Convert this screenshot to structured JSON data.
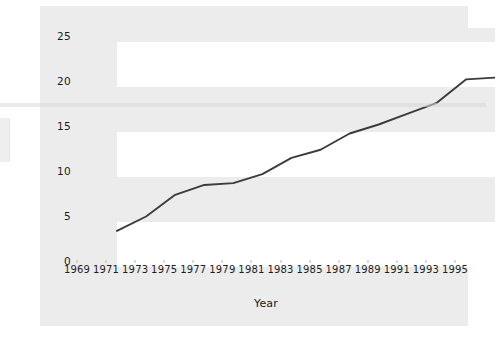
{
  "chart_data": {
    "type": "line",
    "title": "",
    "xlabel": "Year",
    "ylabel": "Women as a Percentage of All State Legislators",
    "x": [
      1969,
      1971,
      1973,
      1975,
      1977,
      1979,
      1981,
      1983,
      1985,
      1987,
      1989,
      1991,
      1993,
      1995
    ],
    "categories": [
      "1969",
      "1971",
      "1973",
      "1975",
      "1977",
      "1979",
      "1981",
      "1983",
      "1985",
      "1987",
      "1989",
      "1991",
      "1993",
      "1995"
    ],
    "values": [
      4.0,
      5.6,
      8.0,
      9.1,
      9.3,
      10.3,
      12.1,
      13.0,
      14.8,
      15.8,
      17.0,
      18.2,
      20.8,
      21.0
    ],
    "series": [
      {
        "name": "Women as a Percentage of All State Legislators",
        "values": [
          4.0,
          5.6,
          8.0,
          9.1,
          9.3,
          10.3,
          12.1,
          13.0,
          14.8,
          15.8,
          17.0,
          18.2,
          20.8,
          21.0
        ],
        "color": "#3b3b3b"
      }
    ],
    "yticks": [
      0,
      5,
      10,
      15,
      20,
      25
    ],
    "ytick_labels": [
      "0",
      "5",
      "10",
      "15",
      "20",
      "25"
    ],
    "ylim": [
      0,
      26.5
    ],
    "xlim": [
      1969,
      1995
    ],
    "grid": false,
    "banding": true,
    "legend": "none",
    "line_color": "#3b3b3b",
    "band_color": "#ffffff",
    "panel_color": "#ececed"
  }
}
